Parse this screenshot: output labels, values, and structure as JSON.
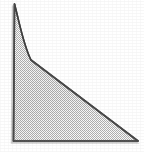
{
  "figure": {
    "canvas": {
      "width": 144,
      "height": 152,
      "background_color": "#ffffff"
    },
    "style": {
      "outline_color": "#4a4a4a",
      "outline_width": 1.6,
      "fill_pattern": "checkerboard-dither-50",
      "fill_light_color": "#ffffff",
      "fill_dark_color": "#b4b4b4",
      "fill_apparent_color": "#d2d2d2",
      "shadow_color": "#c8c8c8"
    },
    "vertices": [
      {
        "name": "apex",
        "x": 14.5,
        "y": 4.0,
        "label": ""
      },
      {
        "name": "knee",
        "x": 31.0,
        "y": 60.0,
        "label": ""
      },
      {
        "name": "bottom-right",
        "x": 138.0,
        "y": 141.0,
        "label": ""
      },
      {
        "name": "bottom-left",
        "x": 13.5,
        "y": 141.0,
        "label": ""
      }
    ],
    "edges": [
      {
        "name": "spike-right-curve",
        "from": "apex",
        "to": "knee",
        "kind": "concave-curve"
      },
      {
        "name": "hypotenuse",
        "from": "knee",
        "to": "bottom-right",
        "kind": "straight"
      },
      {
        "name": "base",
        "from": "bottom-right",
        "to": "bottom-left",
        "kind": "straight"
      },
      {
        "name": "left-side",
        "from": "bottom-left",
        "to": "apex",
        "kind": "straight"
      }
    ],
    "path_d": "M 14.5 4.0 C 19.5 23.0, 23.5 45.5, 31.0 60.0 L 138.0 141.0 L 13.5 141.0 Z",
    "labels": []
  }
}
